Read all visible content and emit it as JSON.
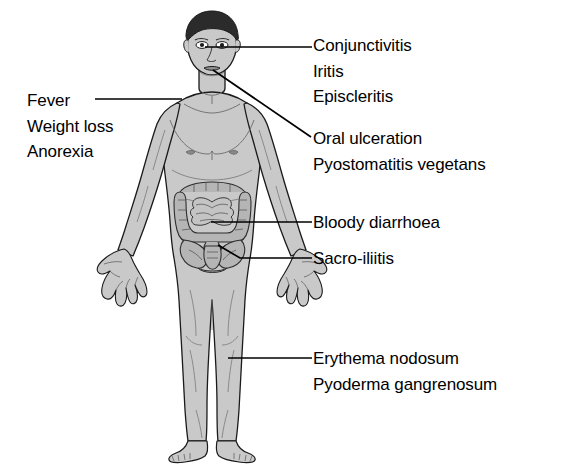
{
  "diagram": {
    "colors": {
      "body_fill": "#c9c9c9",
      "body_outline": "#1a1a1a",
      "hair_fill": "#2b2b2b",
      "organ_fill": "#b5b5b5",
      "organ_outline": "#2e2e2e",
      "leader_line": "#000000",
      "text": "#000000",
      "background": "#ffffff"
    },
    "labels": {
      "eye": {
        "lines": [
          "Conjunctivitis",
          "Iritis",
          "Episcleritis"
        ],
        "line1": "Conjunctivitis",
        "line2": "Iritis",
        "line3": "Episcleritis"
      },
      "mouth": {
        "lines": [
          "Oral ulceration",
          "Pyostomatitis vegetans"
        ],
        "line1": "Oral ulceration",
        "line2": "Pyostomatitis vegetans"
      },
      "bowel": {
        "lines": [
          "Bloody diarrhoea"
        ],
        "line1": "Bloody diarrhoea"
      },
      "sacroiliac": {
        "lines": [
          "Sacro-iliitis"
        ],
        "line1": "Sacro-iliitis"
      },
      "skin": {
        "lines": [
          "Erythema nodosum",
          "Pyoderma gangrenosum"
        ],
        "line1": "Erythema nodosum",
        "line2": "Pyoderma gangrenosum"
      },
      "systemic": {
        "lines": [
          "Fever",
          "Weight loss",
          "Anorexia"
        ],
        "line1": "Fever",
        "line2": "Weight loss",
        "line3": "Anorexia"
      }
    }
  }
}
